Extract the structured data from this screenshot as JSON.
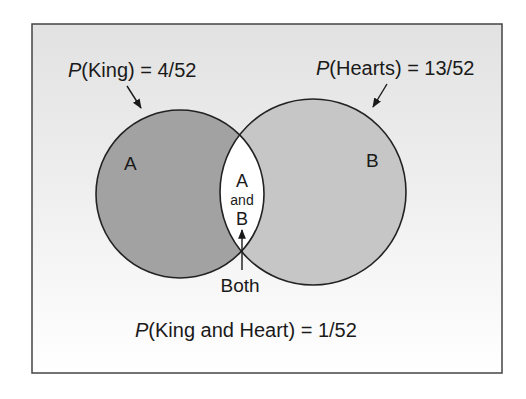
{
  "diagram": {
    "type": "venn",
    "colors": {
      "frame_border": "#444444",
      "bg_top": "#e2e2e2",
      "bg_bottom": "#ffffff",
      "circle_a": "#a2a2a2",
      "circle_b": "#c6c6c6",
      "intersection": "#ffffff",
      "stroke": "#222222"
    },
    "labels": {
      "p_king_italic": "P",
      "p_king_rest": "(King) = 4/52",
      "p_hearts_italic": "P",
      "p_hearts_rest": "(Hearts) = 13/52",
      "circle_a": "A",
      "circle_b": "B",
      "intersection_line1": "A",
      "intersection_line2": "and",
      "intersection_line3": "B",
      "both": "Both",
      "joint_italic": "P",
      "joint_rest": "(King and Heart) = 1/52"
    },
    "sets": [
      {
        "name": "A",
        "event": "King",
        "probability": "4/52"
      },
      {
        "name": "B",
        "event": "Hearts",
        "probability": "13/52"
      }
    ],
    "intersection": {
      "name": "A and B",
      "label": "Both",
      "probability": "1/52"
    }
  }
}
